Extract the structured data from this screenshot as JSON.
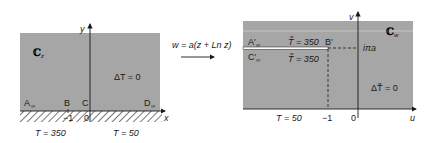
{
  "left_panel": {
    "plane_label": "ℂ",
    "plane_subscript": "z",
    "axis_x": "x",
    "axis_y": "y",
    "equation": "ΔT = 0",
    "points": [
      {
        "label": "A",
        "subscript": "∞"
      },
      {
        "label": "B",
        "subscript": ""
      },
      {
        "label": "C",
        "subscript": ""
      },
      {
        "label": "D",
        "subscript": "∞"
      }
    ],
    "tick_minus_one": "−1",
    "tick_zero": "0",
    "boundary_left": "T = 350",
    "boundary_right": "T = 50"
  },
  "mapping": {
    "formula": "w = a(z + Ln z)"
  },
  "right_panel": {
    "plane_label": "ℂ",
    "plane_subscript": "w",
    "axis_u": "u",
    "axis_v": "v",
    "equation": "ΔT̃ = 0",
    "slit_upper_label": "T̃ = 350",
    "slit_lower_label": "T̃ = 350",
    "point_a_prime": {
      "label": "A′",
      "subscript": "∞"
    },
    "point_b_prime": "B′",
    "point_c_prime": {
      "label": "C′",
      "subscript": "∞"
    },
    "imag_tick": "iπa",
    "tick_minus_one": "−1",
    "tick_zero": "0",
    "boundary_bottom": "T = 50"
  },
  "colors": {
    "region_fill": "#a6a6a6",
    "region_light_band": "#c4c4c4",
    "axis": "#1a1a1a",
    "slit": "#ffffff"
  }
}
